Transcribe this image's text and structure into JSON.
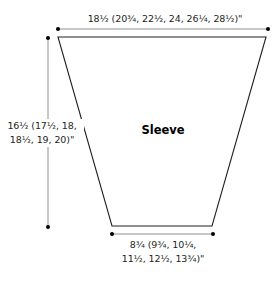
{
  "diagram": {
    "title": "Sleeve",
    "dimensions": {
      "top_width": {
        "text": "18½ (20¾, 22½, 24, 26¼, 28½)\""
      },
      "length": {
        "line1": "16½ (17½, 18,",
        "line2": "18½, 19, 20)\""
      },
      "bottom_width": {
        "line1": "8¾ (9¾, 10¼,",
        "line2": "11½, 12½, 13¾)\""
      }
    },
    "colors": {
      "outline": "#231f20",
      "dimension_line": "#999999",
      "dot": "#000000",
      "background": "#ffffff"
    }
  }
}
